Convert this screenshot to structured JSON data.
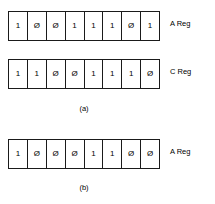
{
  "figure": {
    "registers": [
      {
        "name": "row1",
        "label": "A Reg",
        "bits": [
          "1",
          "Ø",
          "Ø",
          "1",
          "1",
          "1",
          "Ø",
          "1"
        ]
      },
      {
        "name": "row2",
        "label": "C Reg",
        "bits": [
          "1",
          "1",
          "Ø",
          "Ø",
          "1",
          "1",
          "1",
          "Ø"
        ]
      },
      {
        "name": "row3",
        "label": "A Reg",
        "bits": [
          "1",
          "Ø",
          "Ø",
          "Ø",
          "1",
          "1",
          "Ø",
          "Ø"
        ]
      }
    ],
    "captions": {
      "a": "(a)",
      "b": "(b)"
    },
    "colors": {
      "background": "#ffffff",
      "ink": "#1a1a1a"
    }
  }
}
